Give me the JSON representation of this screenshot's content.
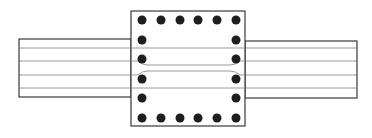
{
  "diagram": {
    "title": "",
    "type": "column-beam joint reinforcement section",
    "colors": {
      "background": "#ffffff",
      "outline": "#3a3a3a",
      "bar_line": "#9a9a9a",
      "rebar_dot": "#1e1e1e"
    },
    "column": {
      "x": 131,
      "y": 11,
      "width": 114,
      "height": 115
    },
    "left_beam": {
      "x": 19,
      "y": 39,
      "width": 112,
      "height": 58
    },
    "right_beam": {
      "x": 245,
      "y": 41,
      "width": 112,
      "height": 57
    },
    "rebar_columns_x": [
      142,
      161,
      180,
      198,
      217,
      236
    ],
    "rebar_rows_y": [
      20,
      40,
      59,
      79,
      98,
      118
    ],
    "rebar_radius": 4.5,
    "beam_bars_y": [
      48,
      61,
      75,
      88
    ],
    "beam_bars_x_range": [
      19,
      357
    ]
  }
}
